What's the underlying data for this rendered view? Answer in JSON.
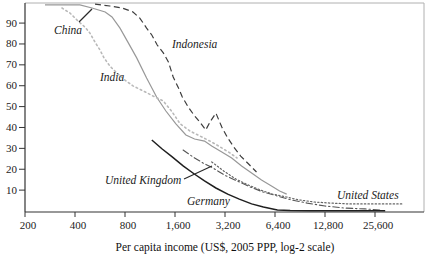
{
  "figure": {
    "x_axis": {
      "title": "Per capita income (US$, 2005 PPP, log-2 scale)",
      "tick_labels": [
        "200",
        "400",
        "800",
        "1,600",
        "3,200",
        "6,400",
        "12,800",
        "25,600"
      ]
    },
    "y_axis": {
      "tick_labels": [
        "10",
        "20",
        "30",
        "40",
        "50",
        "60",
        "70",
        "80",
        "90"
      ]
    }
  },
  "chart_data": {
    "type": "line",
    "title": "",
    "xlabel": "Per capita income (US$, 2005 PPP, log-2 scale)",
    "ylabel": "",
    "x_scale": "log2",
    "xlim": [
      200,
      51200
    ],
    "ylim": [
      0,
      100
    ],
    "x_ticks": [
      200,
      400,
      800,
      1600,
      3200,
      6400,
      12800,
      25600
    ],
    "y_ticks": [
      10,
      20,
      30,
      40,
      50,
      60,
      70,
      80,
      90
    ],
    "grid": false,
    "legend": "inline-labels",
    "series": [
      {
        "name": "China",
        "style": "solid",
        "color": "#989898",
        "points": [
          [
            264,
            98.7
          ],
          [
            428,
            98.7
          ],
          [
            506,
            97.2
          ],
          [
            608,
            95.3
          ],
          [
            668,
            92.9
          ],
          [
            746,
            87.6
          ],
          [
            833,
            80.9
          ],
          [
            941,
            73.3
          ],
          [
            1080,
            63.7
          ],
          [
            1240,
            54.6
          ],
          [
            1410,
            47.9
          ],
          [
            1620,
            41.7
          ],
          [
            1860,
            36.4
          ],
          [
            2100,
            34.5
          ],
          [
            2410,
            33.5
          ],
          [
            2660,
            31.1
          ],
          [
            3060,
            28.3
          ],
          [
            3510,
            25.4
          ],
          [
            4030,
            21.6
          ],
          [
            4630,
            18.2
          ],
          [
            5310,
            14.8
          ],
          [
            6100,
            12.0
          ],
          [
            6820,
            9.6
          ],
          [
            7530,
            8.1
          ]
        ]
      },
      {
        "name": "India",
        "style": "dotted",
        "color": "#b9b9b9",
        "points": [
          [
            334,
            97.2
          ],
          [
            373,
            94.8
          ],
          [
            417,
            91.0
          ],
          [
            459,
            88.1
          ],
          [
            492,
            85.2
          ],
          [
            528,
            80.9
          ],
          [
            566,
            77.1
          ],
          [
            598,
            73.3
          ],
          [
            649,
            69.4
          ],
          [
            715,
            66.1
          ],
          [
            800,
            62.7
          ],
          [
            894,
            59.9
          ],
          [
            1030,
            57.5
          ],
          [
            1180,
            55.1
          ],
          [
            1360,
            52.7
          ],
          [
            1540,
            47.4
          ],
          [
            1720,
            41.7
          ],
          [
            1970,
            38.3
          ],
          [
            2260,
            35.9
          ],
          [
            2600,
            33.5
          ],
          [
            2990,
            30.7
          ],
          [
            3430,
            27.8
          ],
          [
            3780,
            25.4
          ]
        ]
      },
      {
        "name": "Indonesia",
        "style": "dashed",
        "color": "#3d3d3d",
        "points": [
          [
            528,
            99.1
          ],
          [
            649,
            98.2
          ],
          [
            770,
            97.2
          ],
          [
            894,
            95.3
          ],
          [
            982,
            92.4
          ],
          [
            1080,
            87.6
          ],
          [
            1160,
            84.3
          ],
          [
            1250,
            79.5
          ],
          [
            1360,
            75.7
          ],
          [
            1460,
            71.4
          ],
          [
            1560,
            64.2
          ],
          [
            1680,
            58.9
          ],
          [
            1770,
            54.6
          ],
          [
            1920,
            49.8
          ],
          [
            2080,
            46.0
          ],
          [
            2260,
            42.6
          ],
          [
            2450,
            38.8
          ],
          [
            2620,
            43.1
          ],
          [
            2820,
            46.9
          ],
          [
            3060,
            40.2
          ],
          [
            3320,
            35.0
          ],
          [
            3610,
            30.7
          ],
          [
            3980,
            26.3
          ],
          [
            4440,
            22.5
          ],
          [
            4950,
            18.7
          ]
        ]
      },
      {
        "name": "United Kingdom",
        "style": "dash-dot",
        "color": "#555555",
        "points": [
          [
            1790,
            29.2
          ],
          [
            2050,
            25.9
          ],
          [
            2360,
            23.0
          ],
          [
            2710,
            20.6
          ],
          [
            3180,
            17.2
          ],
          [
            3780,
            14.4
          ],
          [
            4530,
            11.5
          ],
          [
            5430,
            9.1
          ],
          [
            6620,
            7.2
          ],
          [
            8020,
            5.3
          ],
          [
            10000,
            3.8
          ],
          [
            12800,
            2.4
          ],
          [
            16900,
            1.4
          ],
          [
            22300,
            1.0
          ],
          [
            27400,
            0.5
          ]
        ]
      },
      {
        "name": "Germany",
        "style": "solid",
        "color": "#1f1f1f",
        "points": [
          [
            1160,
            34.0
          ],
          [
            1340,
            29.7
          ],
          [
            1540,
            25.9
          ],
          [
            1790,
            21.6
          ],
          [
            2090,
            17.7
          ],
          [
            2410,
            14.4
          ],
          [
            2820,
            11.0
          ],
          [
            3320,
            8.1
          ],
          [
            3900,
            5.7
          ],
          [
            4630,
            3.4
          ],
          [
            5450,
            1.9
          ],
          [
            6620,
            0.5
          ],
          [
            7900,
            0.2
          ],
          [
            10400,
            0.1
          ],
          [
            14700,
            0.1
          ],
          [
            20900,
            0.1
          ],
          [
            29500,
            0.1
          ]
        ]
      },
      {
        "name": "United States",
        "style": "fine-dotted",
        "color": "#666666",
        "points": [
          [
            2660,
            23.5
          ],
          [
            3140,
            19.2
          ],
          [
            3720,
            15.3
          ],
          [
            4400,
            12.5
          ],
          [
            5210,
            10.1
          ],
          [
            6170,
            8.1
          ],
          [
            7490,
            6.7
          ],
          [
            8910,
            5.3
          ],
          [
            11000,
            4.3
          ],
          [
            13900,
            3.8
          ],
          [
            17900,
            3.4
          ],
          [
            23600,
            3.4
          ],
          [
            30300,
            3.4
          ],
          [
            37400,
            3.4
          ]
        ]
      }
    ]
  }
}
